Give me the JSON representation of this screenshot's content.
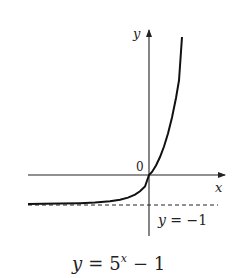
{
  "figure": {
    "function_label": "y = 5^x − 1",
    "caption": {
      "lhs": "y",
      "eq": "=",
      "base": "5",
      "exponent": "x",
      "rest": "− 1"
    },
    "axes": {
      "x_label": "x",
      "y_label": "y",
      "origin_label": "0"
    },
    "asymptote": {
      "label_lhs": "y",
      "label_rest": " = −1",
      "value": -1
    },
    "colors": {
      "ink": "#222222",
      "background": "#ffffff"
    }
  }
}
